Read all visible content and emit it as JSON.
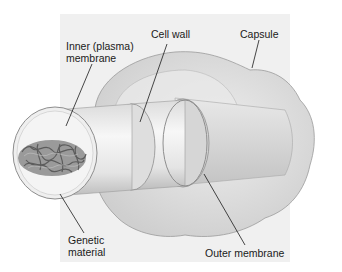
{
  "diagram": {
    "labels": {
      "inner_membrane": {
        "line1": "Inner (plasma)",
        "line2": "membrane"
      },
      "cell_wall": "Cell wall",
      "capsule": "Capsule",
      "genetic_material": {
        "line1": "Genetic",
        "line2": "material"
      },
      "outer_membrane": "Outer membrane"
    },
    "colors": {
      "backdrop": "#f0f0f0",
      "capsule_fill": "#e2e2e2",
      "cylinder_fill": "#ececec",
      "dna_fill": "#8a8a8a",
      "leader_line": "#1a1a1a"
    }
  }
}
